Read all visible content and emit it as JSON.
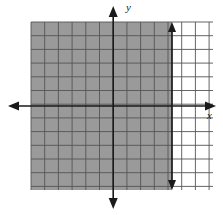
{
  "figure": {
    "kind": "cartesian-grid-inequality-graph",
    "background_color": "#ffffff"
  },
  "axes": {
    "x_label": "x",
    "y_label": "y",
    "axis_color": "#1a1a1a",
    "origin_px": {
      "x": 107,
      "y": 106
    },
    "x_axis": {
      "start_px": 11,
      "end_px": 213,
      "y_px": 106,
      "arrow_left": true,
      "arrow_right": true
    },
    "y_axis": {
      "start_px": 8,
      "end_px": 207,
      "x_px": 107,
      "arrow_top": true,
      "arrow_bottom": true
    }
  },
  "grid": {
    "color": "#555555",
    "spacing_px": 13.7,
    "left_px": 31,
    "right_px": 213,
    "top_px": 22,
    "bottom_px": 190,
    "vertical_lines": [
      31,
      44.7,
      58.4,
      72.1,
      85.8,
      99.5,
      113.2,
      126.9,
      140.6,
      154.3,
      168,
      181.7,
      195.4,
      209.1
    ],
    "horizontal_lines": [
      22,
      35.7,
      49.4,
      63.1,
      76.8,
      90.5,
      104.2,
      117.9,
      131.6,
      145.3,
      159,
      172.7,
      186.4
    ],
    "columns": 13,
    "rows": 12
  },
  "shaded_region": {
    "fill_color": "#9a9a9a",
    "left_px": 31,
    "right_px": 172,
    "top_px": 22,
    "bottom_px": 190,
    "description": "shaded half-plane left of boundary line"
  },
  "boundary_line": {
    "type": "vertical-solid",
    "color": "#1a1a1a",
    "x_px": 172,
    "top_px": 24,
    "bottom_px": 188,
    "arrow_top": true,
    "arrow_bottom": true,
    "x_value_grid_units": 5
  }
}
